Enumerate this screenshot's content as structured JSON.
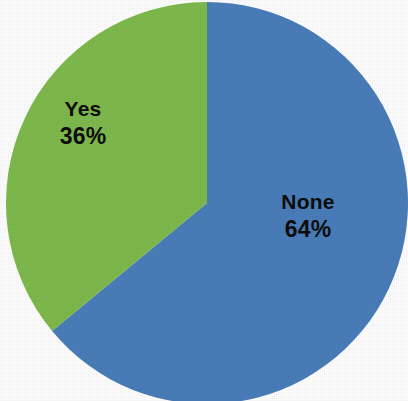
{
  "chart_data": {
    "type": "pie",
    "title": "",
    "subtitle": "",
    "xlabel": "",
    "ylabel": "",
    "legend": "none",
    "grid": false,
    "labels_inside_slices": true,
    "start_angle_deg": 0,
    "direction": "clockwise",
    "categories": [
      "None",
      "Yes"
    ],
    "values": [
      64,
      36
    ],
    "unit": "%",
    "colors": [
      "#4a7ebb",
      "#7fba4d"
    ],
    "slices": [
      {
        "name": "None",
        "label": "None",
        "value": 64,
        "value_label": "64%",
        "color": "#4a7ebb",
        "start_deg": 0,
        "sweep_deg": 230.4
      },
      {
        "name": "Yes",
        "label": "Yes",
        "value": 36,
        "value_label": "36%",
        "color": "#7fba4d",
        "start_deg": 230.4,
        "sweep_deg": 129.6
      }
    ]
  },
  "geometry": {
    "center_x": 207,
    "center_y": 203,
    "radius": 201,
    "background": "#ffffff"
  }
}
